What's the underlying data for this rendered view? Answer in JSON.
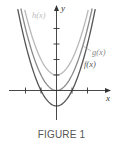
{
  "caption": "FIGURE 1",
  "chart_data": {
    "type": "line",
    "title": "",
    "xlabel": "x",
    "ylabel": "y",
    "xlim": [
      -3,
      3.5
    ],
    "ylim": [
      -2,
      5.5
    ],
    "x_ticks": [
      -2,
      -1,
      1,
      2
    ],
    "y_ticks": [
      1,
      2,
      3,
      4
    ],
    "grid": false,
    "legend": "inline labels",
    "series": [
      {
        "name": "f(x)",
        "expr": "x^2 - 1",
        "vertex": [
          0,
          -1
        ],
        "color": "#555555",
        "label_pos": "right"
      },
      {
        "name": "g(x)",
        "expr": "x^2",
        "vertex": [
          0,
          0
        ],
        "color": "#8a8a8a",
        "label_pos": "right"
      },
      {
        "name": "h(x)",
        "expr": "x^2 + 1",
        "vertex": [
          0,
          1
        ],
        "color": "#b8b8b8",
        "label_pos": "left"
      }
    ]
  },
  "labels": {
    "x_axis": "x",
    "y_axis": "y",
    "f": "f(x)",
    "g": "g(x)",
    "h": "h(x)"
  }
}
